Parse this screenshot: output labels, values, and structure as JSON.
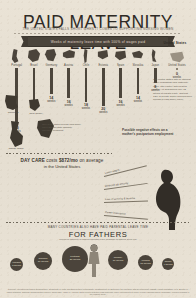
{
  "header": {
    "title": "PAID MATERNITY LEAVE",
    "subtitle": "THE UNITED STATES FALLS SHORT WHEN IT COMES TO SUPPORTING NURSING WOMEN",
    "banner": "Weeks of maternity leave time with 100% of wages paid"
  },
  "chart_data": {
    "type": "bar",
    "title": "Weeks of maternity leave time with 100% of wages paid",
    "xlabel": "",
    "ylabel": "Weeks",
    "ylim": [
      0,
      30
    ],
    "categories": [
      "Portugal",
      "Brazil",
      "Germany",
      "Austria",
      "Chile",
      "Estonia",
      "Spain",
      "Slovakia",
      "Japan",
      "United States"
    ],
    "values": [
      30,
      17,
      14,
      16,
      18,
      20,
      16,
      14,
      8,
      0
    ],
    "value_labels": [
      "30 weeks",
      "17 weeks",
      "14 weeks",
      "16 weeks",
      "18 weeks",
      "20 weeks",
      "16 weeks",
      "14 weeks",
      "8 weeks",
      "0 weeks"
    ],
    "unit": "weeks",
    "highlight": "United States",
    "grid": false,
    "legend": "none"
  },
  "countries": [
    {
      "name": "Portugal",
      "weeks": "30",
      "unit": "weeks"
    },
    {
      "name": "Brazil",
      "weeks": "17",
      "unit": "weeks"
    },
    {
      "name": "Germany",
      "weeks": "14",
      "unit": "weeks"
    },
    {
      "name": "Austria",
      "weeks": "16",
      "unit": "weeks"
    },
    {
      "name": "Chile",
      "weeks": "18",
      "unit": "weeks"
    },
    {
      "name": "Estonia",
      "weeks": "20",
      "unit": "weeks"
    },
    {
      "name": "Spain",
      "weeks": "16",
      "unit": "weeks"
    },
    {
      "name": "Slovakia",
      "weeks": "14",
      "unit": "weeks"
    },
    {
      "name": "Japan",
      "weeks": "8",
      "unit": "weeks"
    },
    {
      "name": "United States",
      "weeks": "0",
      "unit": "weeks"
    }
  ],
  "us_callout": {
    "title": "United States",
    "note": "The United States has no national policy mandating paid maternity leave. The Family and Medical Leave Act guarantees only 12 weeks of unpaid leave, and just 12% of private sector workers have access to paid family leave."
  },
  "states": {
    "note": "Only a few states provide paid family leave through state disability insurance programs.",
    "items": [
      {
        "name": "California",
        "detail": "6 weeks"
      },
      {
        "name": "New Jersey",
        "detail": "6 weeks"
      },
      {
        "name": "Rhode Island",
        "detail": "4 weeks"
      }
    ]
  },
  "daycare": {
    "lead": "DAY CARE",
    "costs_label": "costs",
    "amount": "$872/mo",
    "tail": "on average",
    "sub": "in the United States"
  },
  "negative_effects": {
    "text": "Possible negative effects on a mother's postpartum employment"
  },
  "effects": [
    {
      "label": "Lower wages"
    },
    {
      "label": "Reduced job security"
    },
    {
      "label": "Loss of seniority & benefits"
    },
    {
      "label": "Career interruption"
    }
  ],
  "fathers": {
    "kicker": "MANY COUNTRIES ALSO HAVE PAID PARENTAL LEAVE TIME",
    "headline": "FOR FATHERS",
    "sub": "Weeks of paternity or shared parental leave available to fathers at full pay",
    "bubbles": [
      {
        "country": "Finland",
        "weeks": "3 weeks"
      },
      {
        "country": "Sweden",
        "weeks": "10 weeks"
      },
      {
        "country": "Portugal",
        "weeks": "20 weeks"
      },
      {
        "country": "Norway",
        "weeks": "10 weeks"
      },
      {
        "country": "Iceland",
        "weeks": "13 weeks"
      },
      {
        "country": "Japan",
        "weeks": "4 weeks"
      }
    ]
  },
  "footer": {
    "sources": "Sources: International Labour Organization, Conditions of Work and Employment Programme; Organisation for Economic Co-operation and Development (OECD) Family Database; U.S. Bureau of Labor Statistics, National Compensation Survey; Child Care Aware of America. Data reflects statutory paid maternity leave entitlements at 100% of prior earnings where applicable. Figures rounded to the nearest week."
  },
  "colors": {
    "background": "#e8e1d4",
    "ink": "#3a3530",
    "bar": "#4d463c",
    "bar_highlight": "#8a8173",
    "banner": "#4a443b"
  }
}
